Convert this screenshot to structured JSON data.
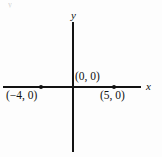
{
  "figure": {
    "artifact_text": "y",
    "background_color": "#fdfdfd",
    "ink_color": "#121212"
  },
  "axes": {
    "x_label": "x",
    "y_label": "y",
    "x_axis_name": "horizontal-axis",
    "y_axis_name": "vertical-axis"
  },
  "labels": {
    "origin": "(0, 0)",
    "point_a": "(−4, 0)",
    "point_b": "(5, 0)"
  },
  "chart_data": {
    "type": "scatter",
    "title": "",
    "xlabel": "x",
    "ylabel": "y",
    "grid": false,
    "legend": null,
    "xlim": [
      -8,
      6
    ],
    "ylim": [
      -6,
      6
    ],
    "points": [
      {
        "label": "(−4, 0)",
        "x": -4,
        "y": 0
      },
      {
        "label": "(0, 0)",
        "x": 0,
        "y": 0
      },
      {
        "label": "(5, 0)",
        "x": 5,
        "y": 0
      }
    ],
    "annotations": [
      {
        "text": "(0, 0)",
        "x": 0,
        "y": 0,
        "position": "above-right"
      },
      {
        "text": "(−4, 0)",
        "x": -4,
        "y": 0,
        "position": "below-left"
      },
      {
        "text": "(5, 0)",
        "x": 5,
        "y": 0,
        "position": "below-left"
      }
    ]
  }
}
